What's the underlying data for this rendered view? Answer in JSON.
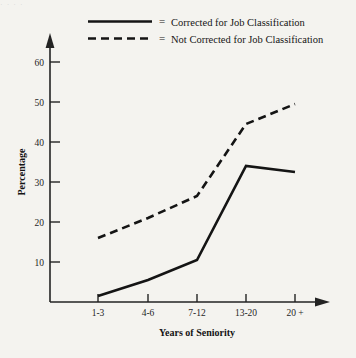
{
  "chart_data": {
    "type": "line",
    "title": "",
    "xlabel": "Years of Seniority",
    "ylabel": "Percentage",
    "categories": [
      "1-3",
      "4-6",
      "7-12",
      "13-20",
      "20 +"
    ],
    "ylim": [
      0,
      62
    ],
    "yticks": [
      10,
      20,
      30,
      40,
      50,
      60
    ],
    "grid": false,
    "legend_position": "top",
    "series": [
      {
        "name": "Corrected for Job Classification",
        "style": "solid",
        "values": [
          1.5,
          5.5,
          10.5,
          34,
          32.5
        ]
      },
      {
        "name": "Not Corrected for Job Classification",
        "style": "dashed",
        "values": [
          16,
          21,
          26.5,
          44.5,
          49.5
        ]
      }
    ]
  },
  "legend": {
    "equals": "=",
    "entries": [
      {
        "label": "Corrected for Job Classification",
        "style": "solid"
      },
      {
        "label": "Not Corrected for Job Classification",
        "style": "dashed"
      }
    ]
  },
  "axes": {
    "y_title": "Percentage",
    "x_title": "Years of Seniority",
    "y_tick_labels": [
      "60",
      "50",
      "40",
      "30",
      "20",
      "10"
    ],
    "x_tick_labels": [
      "1-3",
      "4-6",
      "7-12",
      "13-20",
      "20 +"
    ]
  },
  "colors": {
    "background": "#f4f3ef",
    "ink": "#141414",
    "axis": "#232323"
  },
  "top_cropped_text": "·  ·   ·    ·"
}
